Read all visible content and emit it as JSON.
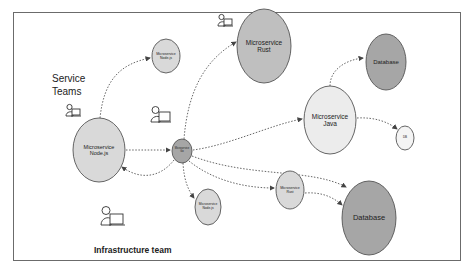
{
  "diagram": {
    "labels": {
      "service_teams_line1": "Service",
      "service_teams_line2": "Teams",
      "infrastructure_team": "Infrastructure team"
    },
    "colors": {
      "frame": "#6b6b6b",
      "node_light": "#d9d9d9",
      "node_lighter": "#ececec",
      "node_dark": "#a6a6a6",
      "stroke": "#555555",
      "arrow": "#555555"
    },
    "nodes": [
      {
        "id": "nodejs-top",
        "line1": "Microservice",
        "line2": "Node.js",
        "cx": 166,
        "cy": 56,
        "rx": 14,
        "ry": 17,
        "fill": "#d9d9d9"
      },
      {
        "id": "nodejs-main",
        "line1": "Microservice",
        "line2": "Node.js",
        "cx": 99,
        "cy": 150,
        "rx": 26,
        "ry": 32,
        "fill": "#d9d9d9"
      },
      {
        "id": "go",
        "line1": "Microservice",
        "line2": "Go",
        "cx": 182,
        "cy": 151,
        "rx": 10,
        "ry": 12,
        "fill": "#a6a6a6"
      },
      {
        "id": "rust-top",
        "line1": "Microservice",
        "line2": "Rust",
        "cx": 264,
        "cy": 46,
        "rx": 27,
        "ry": 37,
        "fill": "#bfbfbf"
      },
      {
        "id": "database-top",
        "line1": "Database",
        "line2": "",
        "cx": 386,
        "cy": 62,
        "rx": 20,
        "ry": 28,
        "fill": "#a6a6a6"
      },
      {
        "id": "java",
        "line1": "Microservice",
        "line2": "Java",
        "cx": 330,
        "cy": 120,
        "rx": 26,
        "ry": 34,
        "fill": "#ececec"
      },
      {
        "id": "db-small",
        "line1": "DB",
        "line2": "",
        "cx": 405,
        "cy": 138,
        "rx": 9,
        "ry": 12,
        "fill": "#f4f4f4"
      },
      {
        "id": "nodejs-bottom",
        "line1": "Microservice",
        "line2": "Node.js",
        "cx": 208,
        "cy": 207,
        "rx": 13,
        "ry": 18,
        "fill": "#d9d9d9"
      },
      {
        "id": "rust-bottom",
        "line1": "Microservice",
        "line2": "Rust",
        "cx": 290,
        "cy": 190,
        "rx": 14,
        "ry": 19,
        "fill": "#d9d9d9"
      },
      {
        "id": "database-bottom",
        "line1": "Database",
        "line2": "",
        "cx": 369,
        "cy": 218,
        "rx": 27,
        "ry": 37,
        "fill": "#a6a6a6"
      }
    ],
    "edges": [
      {
        "from": "nodejs-main",
        "to": "nodejs-top",
        "style": "dotted"
      },
      {
        "from": "nodejs-main",
        "to": "go",
        "style": "dotted"
      },
      {
        "from": "go",
        "to": "nodejs-main",
        "style": "dotted"
      },
      {
        "from": "go",
        "to": "rust-top",
        "style": "dotted"
      },
      {
        "from": "go",
        "to": "java",
        "style": "dotted"
      },
      {
        "from": "go",
        "to": "nodejs-bottom",
        "style": "dotted"
      },
      {
        "from": "go",
        "to": "rust-bottom",
        "style": "dotted"
      },
      {
        "from": "go",
        "to": "database-bottom",
        "style": "dotted"
      },
      {
        "from": "java",
        "to": "database-top",
        "style": "dotted"
      },
      {
        "from": "java",
        "to": "db-small",
        "style": "dotted"
      },
      {
        "from": "rust-bottom",
        "to": "database-bottom",
        "style": "dotted"
      }
    ],
    "people": [
      {
        "id": "person-service-team-1",
        "x": 66,
        "y": 104
      },
      {
        "id": "person-service-team-2",
        "x": 151,
        "y": 106
      },
      {
        "id": "person-service-team-3",
        "x": 218,
        "y": 14
      },
      {
        "id": "person-infrastructure",
        "x": 101,
        "y": 206
      }
    ]
  }
}
